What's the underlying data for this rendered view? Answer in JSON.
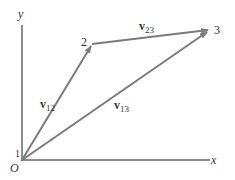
{
  "diagram": {
    "axes": {
      "x_label": "x",
      "y_label": "y",
      "origin_label": "O"
    },
    "points": [
      {
        "id": "1",
        "label": "1"
      },
      {
        "id": "2",
        "label": "2"
      },
      {
        "id": "3",
        "label": "3"
      }
    ],
    "vectors": [
      {
        "id": "v12",
        "symbol": "v",
        "subscript": "12",
        "from": "1",
        "to": "2"
      },
      {
        "id": "v23",
        "symbol": "v",
        "subscript": "23",
        "from": "2",
        "to": "3"
      },
      {
        "id": "v13",
        "symbol": "v",
        "subscript": "13",
        "from": "1",
        "to": "3"
      }
    ],
    "colors": {
      "vector": "#7a7a7a",
      "axis": "#555555",
      "text": "#333333"
    }
  }
}
